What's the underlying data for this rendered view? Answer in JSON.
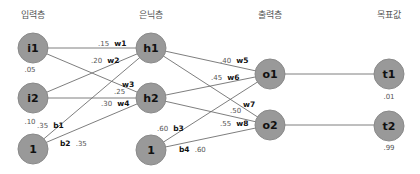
{
  "layers": {
    "input": "입력층",
    "hidden": "은닉층",
    "output": "출력층",
    "target": "목표값"
  },
  "nodes": {
    "i1": {
      "label": "i1",
      "value": ".05"
    },
    "i2": {
      "label": "i2",
      "value": ".10"
    },
    "bias1": {
      "label": "1"
    },
    "h1": {
      "label": "h1"
    },
    "h2": {
      "label": "h2"
    },
    "bias2": {
      "label": "1"
    },
    "o1": {
      "label": "o1"
    },
    "o2": {
      "label": "o2"
    },
    "t1": {
      "label": "t1",
      "value": ".01"
    },
    "t2": {
      "label": "t2",
      "value": ".99"
    }
  },
  "weights": {
    "w1": {
      "name": "w1",
      "value": ".15"
    },
    "w2": {
      "name": "w2",
      "value": ".20"
    },
    "w3": {
      "name": "w3",
      "value": ".25"
    },
    "w4": {
      "name": "w4",
      "value": ".30"
    },
    "w5": {
      "name": "w5",
      "value": ".40"
    },
    "w6": {
      "name": "w6",
      "value": ".45"
    },
    "w7": {
      "name": "w7",
      "value": ".50"
    },
    "w8": {
      "name": "w8",
      "value": ".55"
    },
    "b1": {
      "name": "b1",
      "value": ".35"
    },
    "b2": {
      "name": "b2",
      "value": ".35"
    },
    "b3": {
      "name": "b3",
      "value": ".60"
    },
    "b4": {
      "name": "b4",
      "value": ".60"
    }
  },
  "colors": {
    "node_fill": "#999999",
    "edge": "#6f6f6f",
    "background": "#ffffff"
  }
}
